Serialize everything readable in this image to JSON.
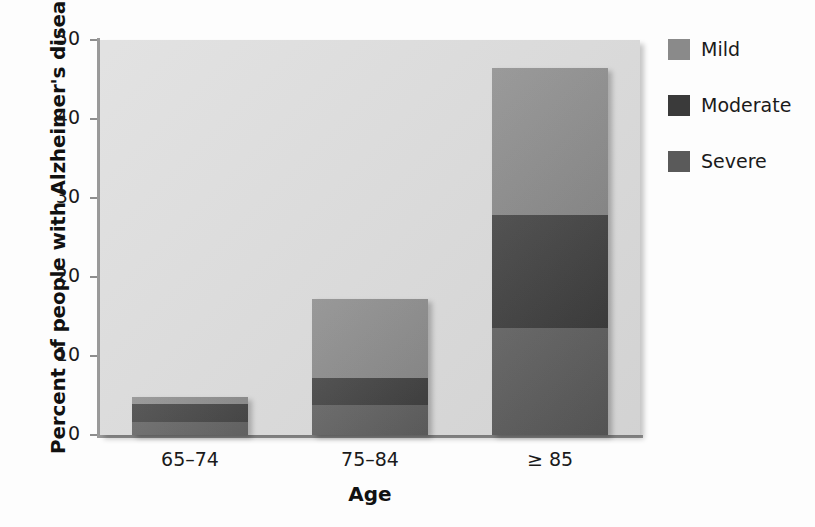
{
  "chart_data": {
    "type": "bar",
    "title": "",
    "subtitle": "",
    "stacked": true,
    "orientation": "vertical",
    "xlabel": "Age",
    "ylabel": "Percent of people with Alzheimer's disease",
    "categories": [
      "65–74",
      "75–84",
      "≥ 85"
    ],
    "ylim": [
      0,
      50
    ],
    "yticks": [
      0,
      10,
      20,
      30,
      40,
      50
    ],
    "ytick_labels": [
      "0",
      "10",
      "20",
      "30",
      "40",
      "50"
    ],
    "grid": false,
    "legend_position": "right",
    "series": [
      {
        "name": "Severe",
        "color": "#5a5a5a",
        "values": [
          1.6,
          3.8,
          13.5
        ]
      },
      {
        "name": "Moderate",
        "color": "#3a3a3a",
        "values": [
          2.3,
          3.4,
          14.3
        ]
      },
      {
        "name": "Mild",
        "color": "#8a8a8a",
        "values": [
          0.9,
          10.0,
          18.7
        ]
      }
    ],
    "totals": [
      4.8,
      17.2,
      46.5
    ],
    "plot_background": "#dcdcdc",
    "annotations": []
  },
  "axes": {
    "y_title": "Percent of people with Alzheimer's disease",
    "x_title": "Age",
    "y_ticks": [
      {
        "value": 50,
        "label": "50"
      },
      {
        "value": 40,
        "label": "40"
      },
      {
        "value": 30,
        "label": "30"
      },
      {
        "value": 20,
        "label": "20"
      },
      {
        "value": 10,
        "label": "10"
      },
      {
        "value": 0,
        "label": "0"
      }
    ],
    "x_ticks": [
      {
        "label": "65–74"
      },
      {
        "label": "75–84"
      },
      {
        "label": "≥ 85"
      }
    ]
  },
  "legend": {
    "items": [
      {
        "label": "Mild",
        "color": "#8a8a8a"
      },
      {
        "label": "Moderate",
        "color": "#3a3a3a"
      },
      {
        "label": "Severe",
        "color": "#5a5a5a"
      }
    ]
  }
}
